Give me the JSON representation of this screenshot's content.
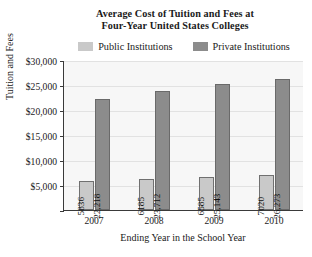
{
  "chart_data": {
    "type": "bar",
    "title": "Average Cost of Tuition and Fees at Four-Year United States Colleges",
    "title_line1": "Average Cost of Tuition and Fees at",
    "title_line2": "Four-Year United States Colleges",
    "xlabel": "Ending Year in the School Year",
    "ylabel": "Tuition and Fees",
    "categories": [
      "2007",
      "2008",
      "2009",
      "2010"
    ],
    "series": [
      {
        "name": "Public Institutions",
        "color": "#c9c9c9",
        "values": [
          5836,
          6185,
          6585,
          7020
        ],
        "labels": [
          "5836",
          "6185",
          "6585",
          "7020"
        ]
      },
      {
        "name": "Private Institutions",
        "color": "#8c8c8c",
        "values": [
          22218,
          23712,
          25143,
          26273
        ],
        "labels": [
          "22,218",
          "23,712",
          "25,143",
          "26,273"
        ]
      }
    ],
    "ylim": [
      0,
      30000
    ],
    "ytick_values": [
      30000,
      25000,
      20000,
      15000,
      10000,
      5000
    ],
    "ytick_labels": [
      "$30,000",
      "$25,000",
      "$20,000",
      "$15,000",
      "$10,000",
      "$5,000"
    ],
    "grid": true,
    "legend_position": "top"
  }
}
